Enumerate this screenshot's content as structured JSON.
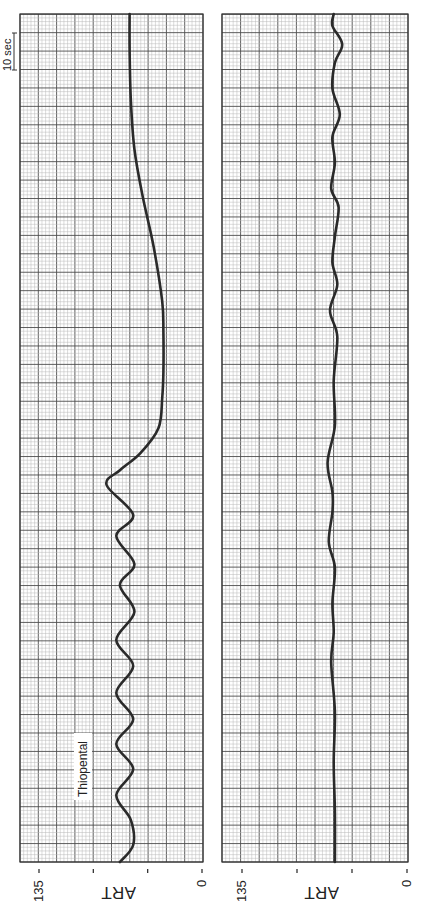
{
  "chart_data": [
    {
      "type": "line",
      "panel": "left",
      "title": "",
      "ylabel": "ART",
      "xlabel": "",
      "value_axis": {
        "min": 0,
        "max": 135,
        "ticks": [
          135,
          90,
          45,
          0
        ],
        "tick_labels": [
          "135",
          "",
          "",
          "0"
        ]
      },
      "time_axis": {
        "unit": "sec",
        "scale_bar": "10 sec",
        "range": [
          0,
          229
        ]
      },
      "grid": true,
      "annotations": [
        {
          "text": "Thiopental",
          "time": 26
        }
      ],
      "series": [
        {
          "name": "ART",
          "points_time_value": [
            [
              0,
              68
            ],
            [
              4.6,
              57
            ],
            [
              11.4,
              59
            ],
            [
              18.1,
              71
            ],
            [
              25.1,
              57
            ],
            [
              31.9,
              71
            ],
            [
              38.6,
              57
            ],
            [
              45.7,
              71
            ],
            [
              53.0,
              57
            ],
            [
              60.0,
              71
            ],
            [
              67.6,
              56
            ],
            [
              74.9,
              68
            ],
            [
              80.5,
              56
            ],
            [
              88.1,
              71
            ],
            [
              93.8,
              57
            ],
            [
              101.9,
              79
            ],
            [
              105.9,
              68
            ],
            [
              110.5,
              51
            ],
            [
              117.3,
              36
            ],
            [
              125.4,
              33
            ],
            [
              132.4,
              32
            ],
            [
              143.2,
              32
            ],
            [
              151.6,
              33
            ],
            [
              166.2,
              40
            ],
            [
              179.7,
              49
            ],
            [
              192.7,
              56
            ],
            [
              206.2,
              59
            ],
            [
              219.7,
              60
            ],
            [
              229.2,
              60
            ]
          ]
        }
      ]
    },
    {
      "type": "line",
      "panel": "right",
      "title": "",
      "ylabel": "ART",
      "xlabel": "",
      "value_axis": {
        "min": 0,
        "max": 135,
        "ticks": [
          135,
          90,
          45,
          0
        ],
        "tick_labels": [
          "135",
          "",
          "",
          "0"
        ]
      },
      "time_axis": {
        "unit": "sec",
        "range": [
          0,
          229
        ]
      },
      "grid": true,
      "series": [
        {
          "name": "ART",
          "points_time_value": [
            [
              0,
              59
            ],
            [
              13.5,
              59
            ],
            [
              27,
              60
            ],
            [
              40.5,
              59
            ],
            [
              54,
              62
            ],
            [
              62,
              60
            ],
            [
              70,
              61
            ],
            [
              79.5,
              59
            ],
            [
              86.5,
              64
            ],
            [
              94.6,
              61
            ],
            [
              100,
              61
            ],
            [
              108,
              65
            ],
            [
              118,
              59
            ],
            [
              130,
              60
            ],
            [
              142,
              57
            ],
            [
              149,
              63
            ],
            [
              156,
              57
            ],
            [
              162,
              61
            ],
            [
              169,
              59
            ],
            [
              177,
              56
            ],
            [
              182,
              62
            ],
            [
              189,
              59
            ],
            [
              196,
              61
            ],
            [
              202,
              55
            ],
            [
              209,
              61
            ],
            [
              216,
              59
            ],
            [
              221,
              53
            ],
            [
              226,
              61
            ],
            [
              229.2,
              60
            ]
          ]
        }
      ]
    }
  ],
  "panels": {
    "left": {
      "axis_title": "ART",
      "tick_labels": [
        "135",
        "0"
      ],
      "annotation": "Thiopental",
      "scale_bar_label": "10 sec"
    },
    "right": {
      "axis_title": "ART",
      "tick_labels": [
        "135",
        "0"
      ]
    }
  },
  "colors": {
    "trace": "#2a2a2a",
    "grid_major": "#4d4d4d",
    "grid_minor": "#b8b8b8",
    "frame": "#333333",
    "background": "#ffffff"
  },
  "layout": {
    "panels": [
      {
        "id": "left",
        "x0": 20,
        "x1": 203,
        "y0": 14,
        "y1": 862,
        "val_x_max": 39,
        "val_x_zero": 202
      },
      {
        "id": "right",
        "x0": 222,
        "x1": 408,
        "y0": 14,
        "y1": 862,
        "val_x_max": 242,
        "val_x_zero": 407
      }
    ],
    "px_per_sec": 3.7
  }
}
